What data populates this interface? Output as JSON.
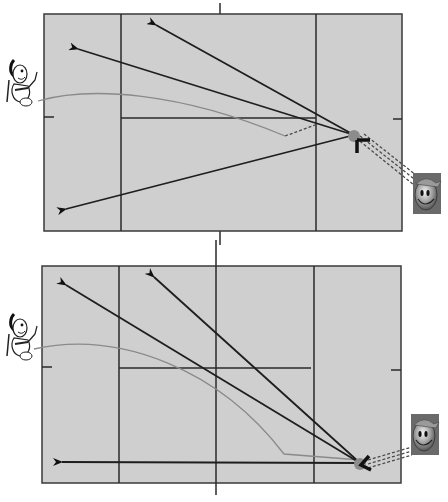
{
  "diagrams": [
    {
      "name": "top-court",
      "court": {
        "x": 44,
        "y": 14,
        "w": 358,
        "h": 217
      },
      "service_lines_x": [
        121,
        316
      ],
      "center_line": {
        "x1": 121,
        "x2": 316,
        "y": 118
      },
      "net_x": 220,
      "side_ticks_y": 117,
      "player_position": {
        "x": 354,
        "y": 135
      },
      "shots_to": [
        [
          154,
          24
        ],
        [
          75,
          48
        ],
        [
          63,
          210
        ]
      ],
      "shuttle_flight": "M44,120 C120,80 230,110 285,135",
      "shuttle_dash": "M285,135 L318,124",
      "coach_link": "M360,140 L420,185",
      "racket_marker": "T-shape"
    },
    {
      "name": "bottom-court",
      "court": {
        "x": 42,
        "y": 266,
        "w": 359,
        "h": 217
      },
      "service_lines_x": [
        119,
        314
      ],
      "center_line": {
        "x1": 119,
        "x2": 311,
        "y": 368
      },
      "net_x": 216,
      "side_ticks_y": 368,
      "player_position": {
        "x": 360,
        "y": 463
      },
      "shots_to": [
        [
          63,
          283
        ],
        [
          151,
          275
        ],
        [
          59,
          462
        ]
      ],
      "shuttle_flight": "M42,343 C140,310 230,390 285,455",
      "shuttle_dash": "",
      "coach_link": "M366,462 L413,447",
      "racket_marker": "chevron"
    }
  ],
  "figures": {
    "left_character": "cartoon-shuttle-player",
    "right_character": "smiley-coach-avatar"
  },
  "colors": {
    "court_fill": "#cfcfcf",
    "lines": "#2a2a2a",
    "flight": "#8a8a8a",
    "player_dot": "#8c8c8c"
  }
}
